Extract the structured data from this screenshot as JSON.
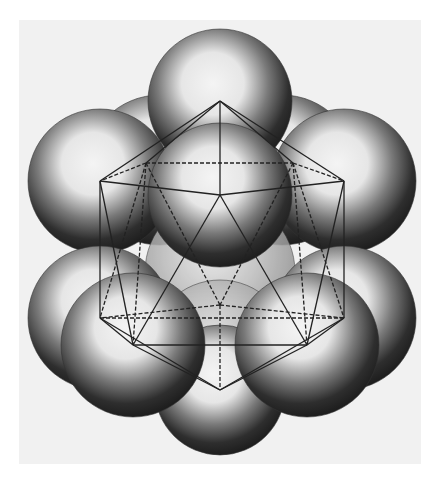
{
  "figure": {
    "background_panel_color": "#f1f1f1",
    "sphere_shade_dark": "#1e1e1e",
    "sphere_shade_light": "#f4f4f4",
    "edge_color": "#222222",
    "spheres": [
      {
        "name": "back-upper-left",
        "cx": 160,
        "cy": 170,
        "r": 75,
        "layer": 0
      },
      {
        "name": "back-upper-right",
        "cx": 282,
        "cy": 170,
        "r": 75,
        "layer": 0
      },
      {
        "name": "back-center",
        "cx": 220,
        "cy": 272,
        "r": 75,
        "layer": 0,
        "faded": true
      },
      {
        "name": "back-lower",
        "cx": 220,
        "cy": 350,
        "r": 70,
        "layer": 0,
        "faded": true
      },
      {
        "name": "top",
        "cx": 220,
        "cy": 101,
        "r": 72,
        "layer": 1
      },
      {
        "name": "left-upper",
        "cx": 100,
        "cy": 181,
        "r": 72,
        "layer": 1
      },
      {
        "name": "right-upper",
        "cx": 344,
        "cy": 181,
        "r": 72,
        "layer": 1
      },
      {
        "name": "left-lower",
        "cx": 100,
        "cy": 318,
        "r": 72,
        "layer": 1
      },
      {
        "name": "right-lower",
        "cx": 344,
        "cy": 318,
        "r": 72,
        "layer": 1
      },
      {
        "name": "bottom",
        "cx": 220,
        "cy": 390,
        "r": 65,
        "layer": 1
      },
      {
        "name": "front-center",
        "cx": 220,
        "cy": 195,
        "r": 72,
        "layer": 2
      },
      {
        "name": "front-lower-left",
        "cx": 133,
        "cy": 345,
        "r": 72,
        "layer": 2
      },
      {
        "name": "front-lower-right",
        "cx": 307,
        "cy": 345,
        "r": 72,
        "layer": 2
      }
    ],
    "vertices": {
      "T": [
        220,
        101
      ],
      "C": [
        220,
        195
      ],
      "LU": [
        100,
        181
      ],
      "RU": [
        344,
        181
      ],
      "BL": [
        146,
        163
      ],
      "BR": [
        293,
        163
      ],
      "LL": [
        100,
        318
      ],
      "RL": [
        344,
        318
      ],
      "FL": [
        133,
        345
      ],
      "FR": [
        307,
        345
      ],
      "M": [
        220,
        305
      ],
      "B": [
        220,
        390
      ],
      "MB": [
        220,
        320
      ]
    },
    "solid_edges": [
      [
        "T",
        "C"
      ],
      [
        "T",
        "LU"
      ],
      [
        "T",
        "RU"
      ],
      [
        "C",
        "LU"
      ],
      [
        "C",
        "RU"
      ],
      [
        "LU",
        "LL"
      ],
      [
        "RU",
        "RL"
      ],
      [
        "LU",
        "FL"
      ],
      [
        "RU",
        "FR"
      ],
      [
        "C",
        "FL"
      ],
      [
        "C",
        "FR"
      ],
      [
        "FL",
        "FR"
      ],
      [
        "LL",
        "FL"
      ],
      [
        "RL",
        "FR"
      ],
      [
        "LL",
        "B"
      ],
      [
        "RL",
        "B"
      ],
      [
        "FL",
        "B"
      ],
      [
        "FR",
        "B"
      ],
      [
        "T",
        "BL"
      ],
      [
        "T",
        "BR"
      ]
    ],
    "dashed_edges": [
      [
        "BL",
        "BR"
      ],
      [
        "BL",
        "LU"
      ],
      [
        "BR",
        "RU"
      ],
      [
        "BL",
        "LL"
      ],
      [
        "BR",
        "RL"
      ],
      [
        "BL",
        "M"
      ],
      [
        "BR",
        "M"
      ],
      [
        "M",
        "LL"
      ],
      [
        "M",
        "RL"
      ],
      [
        "M",
        "B"
      ],
      [
        "LL",
        "RL"
      ],
      [
        "BL",
        "FL"
      ],
      [
        "BR",
        "FR"
      ]
    ]
  }
}
